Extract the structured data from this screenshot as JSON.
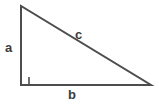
{
  "diagram": {
    "type": "right-triangle",
    "background_color": "#ffffff",
    "stroke_color": "#4d4d4d",
    "label_color": "#3b3b3b",
    "stroke_width": 2,
    "vertices": {
      "apex": {
        "x": 21,
        "y": 6
      },
      "right_angle_corner": {
        "x": 21,
        "y": 85
      },
      "base_right": {
        "x": 151,
        "y": 85
      }
    },
    "right_angle_marker": {
      "present": true,
      "size": 8,
      "x": 21,
      "y": 77
    },
    "labels": {
      "leg_vertical": "a",
      "leg_horizontal": "b",
      "hypotenuse": "c"
    }
  }
}
